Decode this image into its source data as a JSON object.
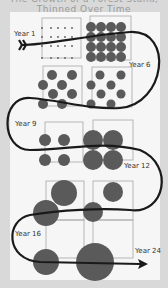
{
  "title": "The Growth of a Forest Stand, Thinned Over Time",
  "colors": {
    "background": "#d9d9d9",
    "panel": "#f6f6f6",
    "tree": "#5a5a5a",
    "box_border": "#a8a8a8",
    "arrow": "#1a1a1a"
  },
  "stages": [
    {
      "label": "Year 1",
      "trees": 16,
      "tree_size": "seedling"
    },
    {
      "label": "Year 6",
      "trees": 16,
      "tree_size": "small"
    },
    {
      "label": "Year 9",
      "trees": 8,
      "tree_size": "small"
    },
    {
      "label": "Year 12",
      "trees": 4,
      "tree_size": "medium"
    },
    {
      "label": "Year 16",
      "trees": 2,
      "tree_size": "large"
    },
    {
      "label": "Year 24",
      "trees": 1,
      "tree_size": "very large"
    }
  ],
  "labels": {
    "year1": "Year 1",
    "year6": "Year 6",
    "year9": "Year 9",
    "year12": "Year 12",
    "year16": "Year 16",
    "year24": "Year 24"
  }
}
